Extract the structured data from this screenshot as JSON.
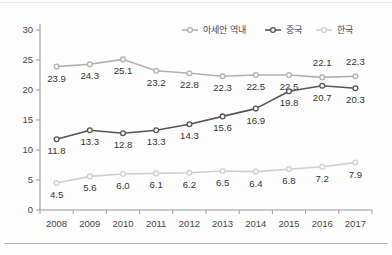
{
  "chart_data": {
    "type": "line",
    "title": "",
    "xlabel": "",
    "ylabel": "",
    "categories": [
      "2008",
      "2009",
      "2010",
      "2011",
      "2012",
      "2013",
      "2014",
      "2015",
      "2016",
      "2017"
    ],
    "ylim": [
      0,
      30
    ],
    "yticks": [
      "0",
      "5",
      "10",
      "15",
      "20",
      "25",
      "30"
    ],
    "grid": false,
    "legend_position": "top-right",
    "series": [
      {
        "name": "아세안 역내",
        "color": "#b0b0b2",
        "marker": "open-circle",
        "values": [
          23.9,
          24.3,
          25.1,
          23.2,
          22.8,
          22.3,
          22.5,
          22.5,
          22.1,
          22.3
        ],
        "labels": [
          "23.9",
          "24.3",
          "25.1",
          "23.2",
          "22.8",
          "22.3",
          "22.5",
          "22.5",
          "22.1",
          "22.3"
        ]
      },
      {
        "name": "중국",
        "color": "#555558",
        "marker": "open-circle",
        "values": [
          11.8,
          13.3,
          12.8,
          13.3,
          14.3,
          15.6,
          16.9,
          19.8,
          20.7,
          20.3
        ],
        "labels": [
          "11.8",
          "13.3",
          "12.8",
          "13.3",
          "14.3",
          "15.6",
          "16.9",
          "19.8",
          "20.7",
          "20.3"
        ]
      },
      {
        "name": "한국",
        "color": "#cfcfd1",
        "marker": "open-circle",
        "values": [
          4.5,
          5.6,
          6.0,
          6.1,
          6.2,
          6.5,
          6.4,
          6.8,
          7.2,
          7.9
        ],
        "labels": [
          "4.5",
          "5.6",
          "6.0",
          "6.1",
          "6.2",
          "6.5",
          "6.4",
          "6.8",
          "7.2",
          "7.9"
        ]
      }
    ]
  },
  "legend": {
    "items": [
      {
        "label": "아세안 역내",
        "color": "#b0b0b2"
      },
      {
        "label": "중국",
        "color": "#555558"
      },
      {
        "label": "한국",
        "color": "#cfcfd1"
      }
    ]
  }
}
